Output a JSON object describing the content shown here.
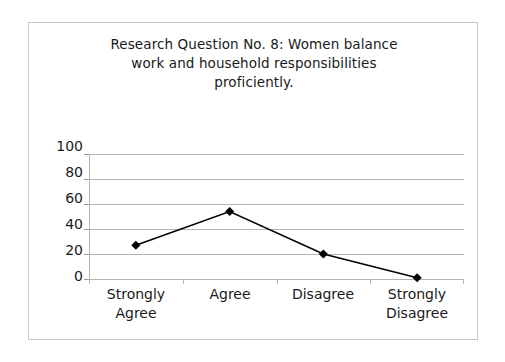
{
  "chart_data": {
    "type": "line",
    "title": "Research Question No. 8:  Women balance\nwork and household responsibilities\nproficiently.",
    "title_lines": [
      "Research Question No. 8:  Women balance",
      "work and household responsibilities",
      "proficiently."
    ],
    "categories": [
      "Strongly Agree",
      "Agree",
      "Disagree",
      "Strongly Disagree"
    ],
    "category_lines": [
      [
        "Strongly",
        "Agree"
      ],
      [
        "Agree"
      ],
      [
        "Disagree"
      ],
      [
        "Strongly",
        "Disagree"
      ]
    ],
    "values": [
      27,
      54,
      20,
      1
    ],
    "xlabel": "",
    "ylabel": "",
    "ylim": [
      0,
      100
    ],
    "yticks": [
      100,
      80,
      60,
      40,
      20,
      0
    ],
    "ytick_labels": [
      "100",
      "80",
      "60",
      "40",
      "20",
      "0"
    ],
    "grid": true,
    "legend": false,
    "marker": "diamond",
    "colors": {
      "series_line": "#000000",
      "marker_fill": "#000000",
      "gridline": "#b4b4b4",
      "axis": "#b4b4b4",
      "text": "#1a1a1a",
      "frame_border": "#c8c8c8",
      "background": "#ffffff"
    }
  }
}
